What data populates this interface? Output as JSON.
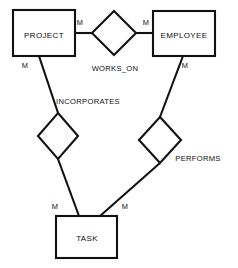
{
  "diagram": {
    "type": "entity-relationship-diagram",
    "background_color": "#ffffff",
    "line_color": "#111111",
    "text_color": "#0f0f0f",
    "entities": [
      {
        "id": "project",
        "label": "PROJECT",
        "x": 13,
        "y": 10,
        "width": 62,
        "height": 46
      },
      {
        "id": "employee",
        "label": "EMPLOYEE",
        "x": 153,
        "y": 11,
        "width": 62,
        "height": 45
      },
      {
        "id": "task",
        "label": "TASK",
        "x": 56,
        "y": 216,
        "width": 61,
        "height": 42
      }
    ],
    "relationships": [
      {
        "id": "works_on",
        "label": "WORKS_ON",
        "cx": 114,
        "cy": 33,
        "rx": 22,
        "ry": 22,
        "label_x": 115,
        "label_y": 71
      },
      {
        "id": "incorporates",
        "label": "INCORPORATES",
        "cx": 58,
        "cy": 136,
        "rx": 20,
        "ry": 23,
        "label_x": 88,
        "label_y": 104
      },
      {
        "id": "performs",
        "label": "PERFORMS",
        "cx": 160,
        "cy": 140,
        "rx": 21,
        "ry": 23,
        "label_x": 198,
        "label_y": 161
      }
    ],
    "connectors": [
      {
        "id": "project-works_on",
        "from": "project",
        "to": "works_on",
        "x1": 75,
        "y1": 33,
        "x2": 92,
        "y2": 33
      },
      {
        "id": "works_on-employee",
        "from": "works_on",
        "to": "employee",
        "x1": 136,
        "y1": 33,
        "x2": 153,
        "y2": 33
      },
      {
        "id": "project-incorporates",
        "from": "project",
        "to": "incorporates",
        "x1": 39,
        "y1": 56,
        "x2": 58,
        "y2": 113
      },
      {
        "id": "incorporates-task",
        "from": "incorporates",
        "to": "task",
        "x1": 58,
        "y1": 159,
        "x2": 79,
        "y2": 216
      },
      {
        "id": "employee-performs",
        "from": "employee",
        "to": "performs",
        "x1": 183,
        "y1": 56,
        "x2": 160,
        "y2": 117
      },
      {
        "id": "performs-task",
        "from": "performs",
        "to": "task",
        "x1": 160,
        "y1": 163,
        "x2": 100,
        "y2": 216
      }
    ],
    "cardinalities": [
      {
        "id": "card-project-works_on",
        "label": "M",
        "x": 80,
        "y": 25
      },
      {
        "id": "card-employee-works_on",
        "label": "M",
        "x": 146,
        "y": 25
      },
      {
        "id": "card-project-incorporates",
        "label": "M",
        "x": 25,
        "y": 68
      },
      {
        "id": "card-employee-performs",
        "label": "M",
        "x": 185,
        "y": 68
      },
      {
        "id": "card-task-incorporates",
        "label": "M",
        "x": 55,
        "y": 209
      },
      {
        "id": "card-task-performs",
        "label": "M",
        "x": 125,
        "y": 209
      }
    ]
  }
}
